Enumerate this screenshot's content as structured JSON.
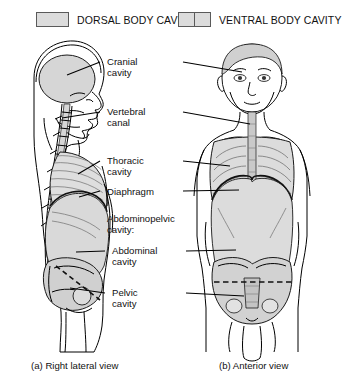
{
  "figure": {
    "legend": [
      {
        "id": "dorsal",
        "label": "DORSAL BODY CAVITY",
        "swatch": "single",
        "color": "#dcdcdc"
      },
      {
        "id": "ventral",
        "label": "VENTRAL BODY CAVITY",
        "swatch": "split",
        "color": "#dcdcdc"
      }
    ],
    "labels": [
      {
        "id": "cranial-cavity",
        "text": "Cranial\ncavity",
        "x": 128,
        "y": 56,
        "leader_left": true,
        "leader_right": true
      },
      {
        "id": "vertebral-canal",
        "text": "Vertebral\ncanal",
        "x": 128,
        "y": 106,
        "leader_left": true,
        "leader_right": true
      },
      {
        "id": "thoracic-cavity",
        "text": "Thoracic\ncavity",
        "x": 128,
        "y": 155,
        "leader_left": true,
        "leader_right": true
      },
      {
        "id": "diaphragm",
        "text": "Diaphragm",
        "x": 128,
        "y": 188,
        "leader_left": true,
        "leader_right": true
      },
      {
        "id": "abdominopelvic-cavity",
        "text": "Abdominopelvic\ncavity:",
        "x": 121,
        "y": 215,
        "leader_left": false,
        "leader_right": false
      },
      {
        "id": "abdominal-cavity",
        "text": "Abdominal\ncavity",
        "x": 133,
        "y": 246,
        "leader_left": true,
        "leader_right": true
      },
      {
        "id": "pelvic-cavity",
        "text": "Pelvic\ncavity",
        "x": 133,
        "y": 288,
        "leader_left": true,
        "leader_right": true
      }
    ],
    "captions": [
      {
        "id": "caption-a",
        "text": "(a) Right lateral view"
      },
      {
        "id": "caption-b",
        "text": "(b) Anterior view"
      }
    ],
    "views": [
      {
        "id": "lateral-view",
        "alt": "Right lateral view of human body showing dorsal and ventral body cavities"
      },
      {
        "id": "anterior-view",
        "alt": "Anterior view of human body showing ventral body cavities"
      }
    ],
    "colors": {
      "cavity_fill": "#d6d6d6",
      "cavity_fill_light": "#e3e3e3",
      "outline": "#1a1a1a",
      "hatch": "#8c8c8c",
      "swatch_border": "#5a5a5a"
    }
  }
}
